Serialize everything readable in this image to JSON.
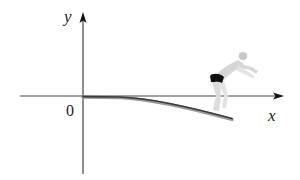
{
  "diagram": {
    "axes": {
      "x_label": "x",
      "y_label": "y",
      "origin_label": "0"
    },
    "objects": [
      {
        "name": "diving-board",
        "description": "Flexible diving board clamped at origin, bending downward along positive x"
      },
      {
        "name": "diver",
        "description": "Diver standing at the free end of the board, arms extended forward"
      }
    ],
    "colors": {
      "axis": "#333333",
      "board_dark": "#3a3a3a",
      "board_light": "#9a9a9a",
      "diver_skin": "#d8d8d8",
      "diver_shorts": "#111111"
    }
  }
}
